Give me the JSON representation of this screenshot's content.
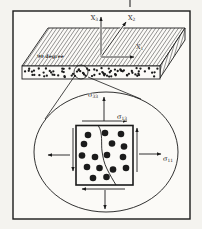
{
  "colors": {
    "paper_outer": "#f4f3ef",
    "paper_inner": "#fbfaf7",
    "ink": "#1b1b1b"
  },
  "labels": {
    "ply_angle": "90 degree",
    "x1": {
      "base": "X",
      "sub": "1"
    },
    "x2": {
      "base": "X",
      "sub": "2"
    },
    "x3": {
      "base": "X",
      "sub": "3"
    },
    "sigma33": {
      "base": "σ",
      "sub": "33"
    },
    "sigma13": {
      "base": "σ",
      "sub": "13"
    },
    "sigma11": {
      "base": "σ",
      "sub": "11"
    }
  },
  "diagram": {
    "frame": {
      "x": 13,
      "y": 11,
      "w": 177,
      "h": 208
    },
    "page_mark": {
      "x": 130,
      "y1": 0,
      "y2": 7
    },
    "lamina": {
      "top_face": [
        [
          22,
          66
        ],
        [
          48,
          28
        ],
        [
          185,
          28
        ],
        [
          160,
          66
        ]
      ],
      "side_face": [
        [
          160,
          66
        ],
        [
          185,
          28
        ],
        [
          185,
          40
        ],
        [
          160,
          78
        ]
      ],
      "front_face": {
        "x": 22,
        "y": 66,
        "w": 138,
        "h": 13
      },
      "fiber_band_dots": {
        "count": 85,
        "radius": 1.15,
        "seed": 11
      },
      "ply_label_pos": {
        "x": 37,
        "y": 58,
        "anchor": "start"
      }
    },
    "axes": {
      "arrows": [
        {
          "name": "axis-x3-arrow",
          "x1": 101,
          "y1": 57,
          "x2": 101,
          "y2": 17
        },
        {
          "name": "axis-x2-arrow",
          "x1": 101,
          "y1": 57,
          "x2": 126,
          "y2": 22
        },
        {
          "name": "axis-x1-arrow",
          "x1": 101,
          "y1": 57,
          "x2": 134,
          "y2": 57
        }
      ],
      "label_pos": {
        "axis-x3-label": {
          "x": 98,
          "y": 20,
          "anchor": "end"
        },
        "axis-x2-label": {
          "x": 128,
          "y": 20,
          "anchor": "start"
        },
        "axis-x1-label": {
          "x": 136,
          "y": 49,
          "anchor": "start"
        }
      }
    },
    "magnifier": {
      "circle": {
        "cx": 81,
        "cy": 72,
        "r": 7
      },
      "cone_lines": [
        {
          "name": "magnifier-cone-line-left",
          "x1": 74,
          "y1": 77,
          "x2": 45,
          "y2": 119
        },
        {
          "name": "magnifier-cone-line-right",
          "x1": 88,
          "y1": 77,
          "x2": 141,
          "y2": 99
        }
      ],
      "ellipse": {
        "cx": 106,
        "cy": 152,
        "rx": 72,
        "ry": 60
      }
    },
    "rve": {
      "square": {
        "x": 76,
        "y": 125.5,
        "w": 57,
        "h": 59.5
      },
      "crack_path": "M 98.5,126 C 103,133 101,144 102,151 C 103,158 104,163 107,169 C 110,175 113,180 116,185",
      "fiber_dots": {
        "radius": 3.3,
        "centers": [
          [
            88,
            135
          ],
          [
            105,
            133
          ],
          [
            121,
            134
          ],
          [
            84,
            144
          ],
          [
            112,
            143.5
          ],
          [
            124,
            146.5
          ],
          [
            82,
            155.5
          ],
          [
            95,
            157
          ],
          [
            107,
            155
          ],
          [
            123,
            157
          ],
          [
            87,
            167
          ],
          [
            99.5,
            168
          ],
          [
            113,
            169.5
          ],
          [
            126,
            168
          ],
          [
            93,
            178
          ],
          [
            106.5,
            177
          ]
        ]
      },
      "stress_arrows": [
        {
          "name": "sigma33-arrow",
          "x1": 104,
          "y1": 121,
          "x2": 104,
          "y2": 97
        },
        {
          "name": "sigma13-arrow",
          "x1": 82,
          "y1": 121,
          "x2": 127,
          "y2": 121
        },
        {
          "name": "left-normal-arrow",
          "x1": 70,
          "y1": 155,
          "x2": 48,
          "y2": 155
        },
        {
          "name": "sigma11-arrow",
          "x1": 139,
          "y1": 154,
          "x2": 161,
          "y2": 154
        },
        {
          "name": "left-shear-arrow",
          "x1": 73,
          "y1": 128,
          "x2": 73,
          "y2": 171
        },
        {
          "name": "right-shear-arrow",
          "x1": 137,
          "y1": 172,
          "x2": 137,
          "y2": 128
        },
        {
          "name": "bottom-shear-arrow",
          "x1": 125,
          "y1": 189,
          "x2": 82,
          "y2": 189
        },
        {
          "name": "bottom-normal-arrow",
          "x1": 105,
          "y1": 190,
          "x2": 105,
          "y2": 209
        }
      ],
      "label_pos": {
        "sigma33-label": {
          "x": 98,
          "y": 97,
          "anchor": "end"
        },
        "sigma13-label": {
          "x": 117,
          "y": 119,
          "anchor": "start"
        },
        "sigma11-label": {
          "x": 163,
          "y": 161,
          "anchor": "start"
        }
      }
    }
  }
}
